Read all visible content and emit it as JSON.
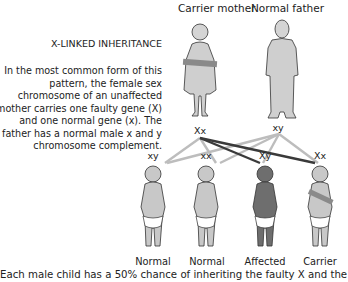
{
  "title": "X-LINKED INHERITANCE",
  "description": "In the most common form of this pattern, the female sex chromosome of an unaffected mother carries one faulty gene (X) and one normal gene (x). The father has a normal male x and y chromosome complement.",
  "parents": [
    {
      "label": "Carrier mother",
      "genotype": "Xx",
      "status": "carrier"
    },
    {
      "label": "Normal father",
      "genotype": "xy",
      "status": "normal"
    }
  ],
  "children": [
    {
      "genotype": "xy",
      "label": "Normal",
      "status": "normal"
    },
    {
      "genotype": "xx",
      "label": "Normal",
      "status": "normal"
    },
    {
      "genotype": "Xy",
      "label": "Affected",
      "status": "affected"
    },
    {
      "genotype": "Xx",
      "label": "Carrier",
      "status": "carrier"
    }
  ],
  "footer": "Each male child has a 50% chance of inheriting the faulty X and the",
  "colors": {
    "figure_normal": "#c8c8c8",
    "figure_affected": "#6e6e6e",
    "carrier_band": "#8a8a8a",
    "faulty_line": "#3a3a3a",
    "normal_line": "#bdbdbd"
  }
}
